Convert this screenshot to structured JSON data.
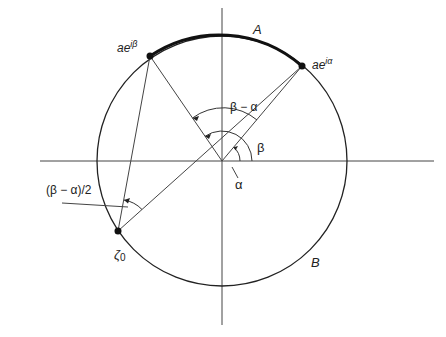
{
  "diagram": {
    "type": "geometry",
    "labels": {
      "point_beta_base": "ae",
      "point_beta_exp": "iβ",
      "point_alpha_base": "ae",
      "point_alpha_exp": "iα",
      "arc_A": "A",
      "arc_B": "B",
      "angle_beta_minus_alpha": "β − α",
      "angle_beta": "β",
      "angle_alpha": "α",
      "half_angle": "(β − α)/2",
      "zeta0_base": "ζ",
      "zeta0_sub": "0"
    },
    "geometry": {
      "center": [
        222,
        161
      ],
      "radius": 125,
      "point_alpha": [
        302,
        66
      ],
      "point_beta": [
        150,
        56
      ],
      "point_zeta0": [
        118,
        231
      ]
    },
    "colors": {
      "stroke": "#222222",
      "background": "#ffffff"
    }
  }
}
